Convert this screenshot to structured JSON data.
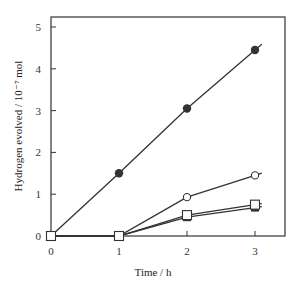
{
  "chart_data": {
    "type": "line",
    "title": "",
    "xlabel": "Time / h",
    "ylabel": "Hydrogen evolved / 10⁻⁷ mol",
    "xlim": [
      0,
      3.3
    ],
    "ylim": [
      0,
      5.2
    ],
    "x_ticks": [
      0,
      1,
      2,
      3
    ],
    "y_ticks": [
      0,
      1,
      2,
      3,
      4,
      5
    ],
    "grid": false,
    "legend": null,
    "x": [
      0,
      1,
      2,
      3
    ],
    "series": [
      {
        "name": "filled-circle",
        "marker": "circle-filled",
        "values": [
          0,
          1.5,
          3.05,
          4.45
        ]
      },
      {
        "name": "open-circle",
        "marker": "circle-open",
        "values": [
          0,
          0,
          0.93,
          1.45
        ]
      },
      {
        "name": "open-square",
        "marker": "square-open",
        "values": [
          0,
          0,
          0.5,
          0.75
        ]
      },
      {
        "name": "filled-square",
        "marker": "square-filled",
        "values": [
          0,
          0,
          0.45,
          0.68
        ]
      }
    ]
  },
  "labels": {
    "xlabel": "Time / h",
    "ylabel": "Hydrogen evolved / 10⁻⁷ mol"
  }
}
